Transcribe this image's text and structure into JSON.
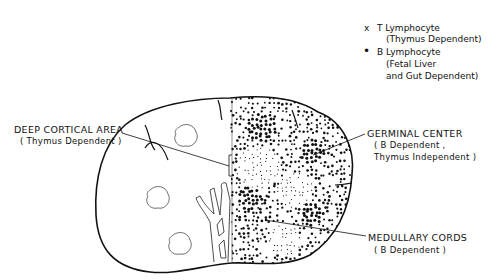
{
  "legend": {
    "items": [
      {
        "marker": "x",
        "marker_name": "x-marker",
        "label": "T Lymphocyte",
        "detail_lines": [
          "(Thymus Dependent)"
        ]
      },
      {
        "marker": "•",
        "marker_name": "dot-marker",
        "label": "B Lymphocyte",
        "detail_lines": [
          "(Fetal Liver",
          "and Gut Dependent)"
        ]
      }
    ]
  },
  "labels": {
    "deep_cortical": {
      "title": "DEEP CORTICAL AREA",
      "sub": "( Thymus Dependent )"
    },
    "germinal_center": {
      "title": "GERMINAL CENTER",
      "sub1": "( B Dependent ,",
      "sub2": "Thymus Independent )"
    },
    "medullary_cords": {
      "title": "MEDULLARY CORDS",
      "sub": "( B Dependent )"
    }
  },
  "colors": {
    "ink": "#111111",
    "background": "#ffffff"
  }
}
